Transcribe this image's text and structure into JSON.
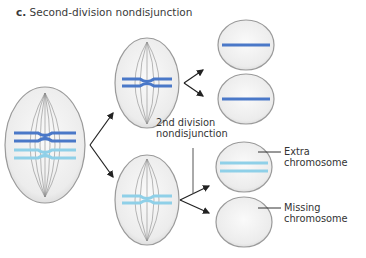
{
  "figure": {
    "panel_letter": "c.",
    "title": "Second-division nondisjunction"
  },
  "labels": {
    "nondisjunction_line1": "2nd division",
    "nondisjunction_line2": "nondisjunction",
    "extra_line1": "Extra",
    "extra_line2": "chromosome",
    "missing_line1": "Missing",
    "missing_line2": "chromosome"
  },
  "colors": {
    "dark_chromosome": "#4a78c8",
    "light_chromosome": "#8fd0e8",
    "cell_fill": "#ececec",
    "cell_stroke": "#9a9a9a",
    "arrow": "#222222"
  }
}
